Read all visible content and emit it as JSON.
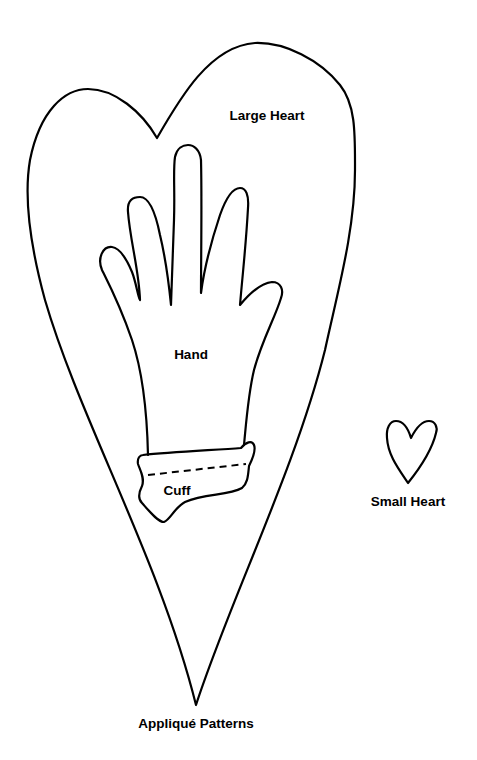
{
  "title": "Appliqué Patterns",
  "shapes": {
    "large_heart": {
      "label": "Large Heart"
    },
    "hand": {
      "label": "Hand"
    },
    "cuff": {
      "label": "Cuff"
    },
    "small_heart": {
      "label": "Small Heart"
    }
  },
  "colors": {
    "stroke": "#000000",
    "background": "#ffffff"
  }
}
